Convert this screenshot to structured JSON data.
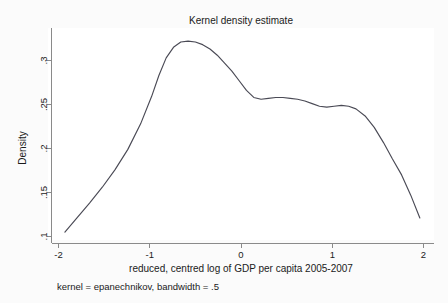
{
  "figure": {
    "title": "Kernel density estimate",
    "note": "kernel = epanechnikov, bandwidth = .5",
    "background_color": "#fbfbfb",
    "plot_background_color": "#ffffff",
    "curve_color": "#4a4a55",
    "axis_color": "#8a8a8a"
  },
  "chart_data": {
    "type": "line",
    "title": "Kernel density estimate",
    "xlabel": "reduced, centred log of GDP per capita 2005-2007",
    "ylabel": "Density",
    "annotation": "kernel = epanechnikov, bandwidth = .5",
    "xlim": [
      -2,
      2
    ],
    "ylim": [
      0.1,
      0.325
    ],
    "grid": false,
    "legend": false,
    "xticks": [
      -2,
      -1,
      0,
      1,
      2
    ],
    "xtick_labels": [
      "-2",
      "-1",
      "0",
      "1",
      "2"
    ],
    "yticks": [
      0.1,
      0.15,
      0.2,
      0.25,
      0.3
    ],
    "ytick_labels": [
      ".1",
      ".15",
      ".2",
      ".25",
      ".3"
    ],
    "series": [
      {
        "name": "Density",
        "kernel": "epanechnikov",
        "bandwidth": 0.5,
        "x": [
          -1.93,
          -1.8,
          -1.66,
          -1.52,
          -1.38,
          -1.24,
          -1.1,
          -0.98,
          -0.9,
          -0.82,
          -0.74,
          -0.66,
          -0.58,
          -0.5,
          -0.42,
          -0.34,
          -0.26,
          -0.18,
          -0.1,
          -0.02,
          0.06,
          0.14,
          0.22,
          0.3,
          0.38,
          0.46,
          0.54,
          0.62,
          0.7,
          0.78,
          0.86,
          0.94,
          1.02,
          1.1,
          1.18,
          1.26,
          1.36,
          1.46,
          1.56,
          1.66,
          1.76,
          1.86,
          1.96
        ],
        "y": [
          0.105,
          0.121,
          0.138,
          0.156,
          0.176,
          0.199,
          0.228,
          0.259,
          0.283,
          0.303,
          0.315,
          0.321,
          0.322,
          0.321,
          0.318,
          0.313,
          0.306,
          0.297,
          0.288,
          0.277,
          0.266,
          0.258,
          0.256,
          0.257,
          0.258,
          0.258,
          0.257,
          0.256,
          0.254,
          0.251,
          0.248,
          0.247,
          0.248,
          0.249,
          0.248,
          0.245,
          0.237,
          0.224,
          0.207,
          0.188,
          0.17,
          0.147,
          0.121
        ]
      }
    ]
  },
  "axes": {
    "x_axis_title": "reduced, centred log of GDP per capita 2005-2007",
    "y_axis_title": "Density",
    "x_tick_labels": [
      "-2",
      "-1",
      "0",
      "1",
      "2"
    ],
    "y_tick_labels": [
      ".3",
      ".25",
      ".2",
      ".15",
      ".1"
    ]
  }
}
